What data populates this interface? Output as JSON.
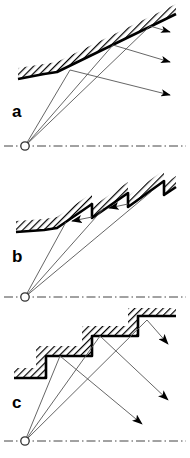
{
  "figure": {
    "background_color": "#ffffff",
    "ink_color": "#000000",
    "ray_color": "#555555",
    "panel_count": 3
  },
  "panels": [
    {
      "id": "a",
      "label": "a",
      "surface_name": "smooth-inclined-surface",
      "surface_description": "flat horizontal section joining a straight inclined ramp",
      "hatch_style": "diagonal",
      "source_point": {
        "x": 25,
        "y": 146,
        "marker": "circle"
      },
      "axis": {
        "style": "dash-dot",
        "y": 146,
        "x_start": 4,
        "x_end": 186
      },
      "surface_outline": [
        {
          "x": 18,
          "y": 79
        },
        {
          "x": 44,
          "y": 74
        },
        {
          "x": 57,
          "y": 72
        },
        {
          "x": 176,
          "y": 14
        }
      ],
      "hatch_band_thickness": 11,
      "incident_rays": [
        {
          "from": [
            25,
            146
          ],
          "to": [
            70,
            70
          ]
        },
        {
          "from": [
            25,
            146
          ],
          "to": [
            113,
            45
          ]
        },
        {
          "from": [
            25,
            146
          ],
          "to": [
            150,
            26
          ]
        }
      ],
      "reflected_rays": [
        {
          "from": [
            70,
            70
          ],
          "to": [
            176,
            96
          ],
          "arrow": "right",
          "direction_deg": 14
        },
        {
          "from": [
            113,
            45
          ],
          "to": [
            176,
            63
          ],
          "arrow": "right",
          "direction_deg": 16
        },
        {
          "from": [
            150,
            26
          ],
          "to": [
            176,
            33
          ],
          "arrow": "right",
          "direction_deg": 15
        }
      ],
      "arrow_count": 3,
      "arrow_direction": "outward-right",
      "note": "specular reflection, rays diverge outward to the right"
    },
    {
      "id": "b",
      "label": "b",
      "surface_name": "sawtooth-surface",
      "surface_description": "rising sawtooth ramps with vertical drop-backs",
      "hatch_style": "diagonal",
      "source_point": {
        "x": 25,
        "y": 137,
        "marker": "circle"
      },
      "axis": {
        "style": "dash-dot",
        "y": 137,
        "x_start": 4,
        "x_end": 186
      },
      "surface_outline": [
        {
          "x": 16,
          "y": 72
        },
        {
          "x": 44,
          "y": 70
        },
        {
          "x": 57,
          "y": 68
        },
        {
          "x": 92,
          "y": 44
        },
        {
          "x": 92,
          "y": 58
        },
        {
          "x": 128,
          "y": 33
        },
        {
          "x": 128,
          "y": 47
        },
        {
          "x": 164,
          "y": 21
        },
        {
          "x": 164,
          "y": 35
        },
        {
          "x": 176,
          "y": 27
        }
      ],
      "hatch_band_thickness": 11,
      "incident_rays": [
        {
          "from": [
            25,
            137
          ],
          "to": [
            66,
            62
          ]
        },
        {
          "from": [
            25,
            137
          ],
          "to": [
            104,
            48
          ]
        },
        {
          "from": [
            25,
            137
          ],
          "to": [
            150,
            32
          ]
        }
      ],
      "reflected_rays": [
        {
          "from": [
            66,
            62
          ],
          "to": [
            92,
            57
          ],
          "arrow": "left",
          "direction_deg": 190
        },
        {
          "from": [
            104,
            48
          ],
          "to": [
            128,
            44
          ],
          "arrow": "left",
          "direction_deg": 190
        }
      ],
      "arrow_count": 2,
      "arrow_direction": "inward-left",
      "note": "rays are trapped and reflected back into the sawtooth grooves"
    },
    {
      "id": "c",
      "label": "c",
      "surface_name": "staircase-surface",
      "surface_description": "stepped staircase with horizontal treads and vertical risers",
      "hatch_style": "diagonal",
      "source_point": {
        "x": 25,
        "y": 133,
        "marker": "circle"
      },
      "axis": {
        "style": "dash-dot",
        "y": 133,
        "x_start": 4,
        "x_end": 186
      },
      "surface_outline": [
        {
          "x": 14,
          "y": 70
        },
        {
          "x": 46,
          "y": 70
        },
        {
          "x": 46,
          "y": 48
        },
        {
          "x": 92,
          "y": 48
        },
        {
          "x": 92,
          "y": 28
        },
        {
          "x": 138,
          "y": 28
        },
        {
          "x": 138,
          "y": 8
        },
        {
          "x": 176,
          "y": 8
        }
      ],
      "hatch_band_thickness": 11,
      "incident_rays": [
        {
          "from": [
            25,
            133
          ],
          "to": [
            60,
            48
          ]
        },
        {
          "from": [
            25,
            133
          ],
          "to": [
            100,
            30
          ]
        },
        {
          "from": [
            25,
            133
          ],
          "to": [
            147,
            14
          ]
        }
      ],
      "reflected_rays": [
        {
          "from": [
            147,
            14
          ],
          "to": [
            176,
            44
          ],
          "arrow": "down-right",
          "direction_deg": 45
        },
        {
          "from": [
            100,
            30
          ],
          "to": [
            176,
            100
          ],
          "arrow": "down-right",
          "direction_deg": 43
        },
        {
          "from": [
            60,
            48
          ],
          "to": [
            150,
            122
          ],
          "arrow": "down-right",
          "direction_deg": 39
        }
      ],
      "arrow_count": 3,
      "arrow_direction": "downward-right",
      "note": "rays cross and are redirected downward to the right"
    }
  ]
}
